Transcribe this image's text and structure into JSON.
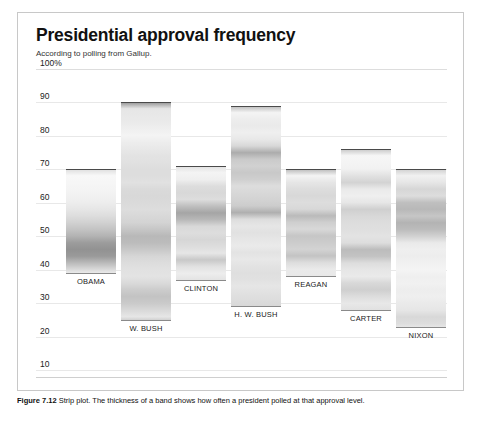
{
  "figure": {
    "title": "Presidential approval frequency",
    "subtitle": "According to polling from Gallup.",
    "caption_label": "Figure 7.12",
    "caption_text": "Strip plot. The thickness of a band shows how often a president polled at that approval level."
  },
  "chart_data": {
    "type": "strip",
    "title": "Presidential approval frequency",
    "subtitle": "According to polling from Gallup.",
    "xlabel": "",
    "ylabel": "",
    "ylim": [
      5,
      103
    ],
    "grid": true,
    "legend": "none",
    "y_ticks": [
      "100%",
      "90",
      "80",
      "70",
      "60",
      "50",
      "40",
      "30",
      "20",
      "10"
    ],
    "y_tick_values": [
      100,
      90,
      80,
      70,
      60,
      50,
      40,
      30,
      20,
      10
    ],
    "categories": [
      "OBAMA",
      "W. BUSH",
      "CLINTON",
      "H. W. BUSH",
      "REAGAN",
      "CARTER",
      "NIXON"
    ],
    "series": [
      {
        "name": "OBAMA",
        "label": "OBAMA",
        "min": 39,
        "max": 70,
        "median": 47,
        "bands": [
          {
            "value": 70,
            "density": 0.3
          },
          {
            "value": 68,
            "density": 0.06
          },
          {
            "value": 66,
            "density": 0.08
          },
          {
            "value": 64,
            "density": 0.1
          },
          {
            "value": 62,
            "density": 0.12
          },
          {
            "value": 60,
            "density": 0.16
          },
          {
            "value": 58,
            "density": 0.22
          },
          {
            "value": 56,
            "density": 0.3
          },
          {
            "value": 54,
            "density": 0.4
          },
          {
            "value": 52,
            "density": 0.52
          },
          {
            "value": 50,
            "density": 0.66
          },
          {
            "value": 48,
            "density": 0.86
          },
          {
            "value": 46,
            "density": 0.95
          },
          {
            "value": 44,
            "density": 0.88
          },
          {
            "value": 42,
            "density": 0.6
          },
          {
            "value": 40,
            "density": 0.32
          },
          {
            "value": 39,
            "density": 0.18
          }
        ]
      },
      {
        "name": "W. BUSH",
        "label": "W. BUSH",
        "min": 25,
        "max": 90,
        "median": 49,
        "bands": [
          {
            "value": 90,
            "density": 0.95
          },
          {
            "value": 88,
            "density": 0.22
          },
          {
            "value": 86,
            "density": 0.2
          },
          {
            "value": 84,
            "density": 0.18
          },
          {
            "value": 82,
            "density": 0.14
          },
          {
            "value": 80,
            "density": 0.1
          },
          {
            "value": 78,
            "density": 0.16
          },
          {
            "value": 76,
            "density": 0.2
          },
          {
            "value": 74,
            "density": 0.24
          },
          {
            "value": 72,
            "density": 0.26
          },
          {
            "value": 70,
            "density": 0.3
          },
          {
            "value": 68,
            "density": 0.3
          },
          {
            "value": 66,
            "density": 0.26
          },
          {
            "value": 64,
            "density": 0.32
          },
          {
            "value": 62,
            "density": 0.34
          },
          {
            "value": 60,
            "density": 0.32
          },
          {
            "value": 58,
            "density": 0.3
          },
          {
            "value": 56,
            "density": 0.34
          },
          {
            "value": 54,
            "density": 0.38
          },
          {
            "value": 52,
            "density": 0.5
          },
          {
            "value": 50,
            "density": 0.62
          },
          {
            "value": 48,
            "density": 0.58
          },
          {
            "value": 46,
            "density": 0.48
          },
          {
            "value": 44,
            "density": 0.36
          },
          {
            "value": 42,
            "density": 0.3
          },
          {
            "value": 40,
            "density": 0.26
          },
          {
            "value": 38,
            "density": 0.24
          },
          {
            "value": 36,
            "density": 0.32
          },
          {
            "value": 34,
            "density": 0.44
          },
          {
            "value": 32,
            "density": 0.52
          },
          {
            "value": 30,
            "density": 0.46
          },
          {
            "value": 28,
            "density": 0.34
          },
          {
            "value": 26,
            "density": 0.22
          },
          {
            "value": 25,
            "density": 0.4
          }
        ]
      },
      {
        "name": "CLINTON",
        "label": "CLINTON",
        "min": 37,
        "max": 71,
        "median": 57,
        "bands": [
          {
            "value": 71,
            "density": 0.26
          },
          {
            "value": 69,
            "density": 0.1
          },
          {
            "value": 67,
            "density": 0.14
          },
          {
            "value": 65,
            "density": 0.3
          },
          {
            "value": 63,
            "density": 0.34
          },
          {
            "value": 61,
            "density": 0.3
          },
          {
            "value": 59,
            "density": 0.56
          },
          {
            "value": 57,
            "density": 0.78
          },
          {
            "value": 55,
            "density": 0.62
          },
          {
            "value": 53,
            "density": 0.34
          },
          {
            "value": 51,
            "density": 0.3
          },
          {
            "value": 49,
            "density": 0.36
          },
          {
            "value": 47,
            "density": 0.3
          },
          {
            "value": 45,
            "density": 0.22
          },
          {
            "value": 43,
            "density": 0.48
          },
          {
            "value": 41,
            "density": 0.26
          },
          {
            "value": 39,
            "density": 0.16
          },
          {
            "value": 37,
            "density": 0.24
          }
        ]
      },
      {
        "name": "H. W. BUSH",
        "label": "H. W. BUSH",
        "min": 29,
        "max": 89,
        "median": 61,
        "bands": [
          {
            "value": 89,
            "density": 0.6
          },
          {
            "value": 87,
            "density": 0.1
          },
          {
            "value": 85,
            "density": 0.16
          },
          {
            "value": 83,
            "density": 0.18
          },
          {
            "value": 81,
            "density": 0.14
          },
          {
            "value": 79,
            "density": 0.2
          },
          {
            "value": 77,
            "density": 0.34
          },
          {
            "value": 75,
            "density": 0.72
          },
          {
            "value": 73,
            "density": 0.46
          },
          {
            "value": 71,
            "density": 0.4
          },
          {
            "value": 69,
            "density": 0.48
          },
          {
            "value": 67,
            "density": 0.42
          },
          {
            "value": 65,
            "density": 0.3
          },
          {
            "value": 63,
            "density": 0.34
          },
          {
            "value": 61,
            "density": 0.38
          },
          {
            "value": 59,
            "density": 0.44
          },
          {
            "value": 57,
            "density": 0.7
          },
          {
            "value": 55,
            "density": 0.3
          },
          {
            "value": 53,
            "density": 0.22
          },
          {
            "value": 51,
            "density": 0.26
          },
          {
            "value": 49,
            "density": 0.22
          },
          {
            "value": 47,
            "density": 0.18
          },
          {
            "value": 45,
            "density": 0.24
          },
          {
            "value": 43,
            "density": 0.2
          },
          {
            "value": 41,
            "density": 0.24
          },
          {
            "value": 39,
            "density": 0.28
          },
          {
            "value": 37,
            "density": 0.26
          },
          {
            "value": 35,
            "density": 0.22
          },
          {
            "value": 33,
            "density": 0.26
          },
          {
            "value": 31,
            "density": 0.3
          },
          {
            "value": 29,
            "density": 0.34
          }
        ]
      },
      {
        "name": "REAGAN",
        "label": "REAGAN",
        "min": 38,
        "max": 70,
        "median": 53,
        "bands": [
          {
            "value": 70,
            "density": 0.62
          },
          {
            "value": 68,
            "density": 0.1
          },
          {
            "value": 66,
            "density": 0.22
          },
          {
            "value": 64,
            "density": 0.3
          },
          {
            "value": 62,
            "density": 0.34
          },
          {
            "value": 60,
            "density": 0.3
          },
          {
            "value": 58,
            "density": 0.34
          },
          {
            "value": 56,
            "density": 0.6
          },
          {
            "value": 54,
            "density": 0.42
          },
          {
            "value": 52,
            "density": 0.34
          },
          {
            "value": 50,
            "density": 0.5
          },
          {
            "value": 48,
            "density": 0.44
          },
          {
            "value": 46,
            "density": 0.38
          },
          {
            "value": 44,
            "density": 0.52
          },
          {
            "value": 42,
            "density": 0.3
          },
          {
            "value": 40,
            "density": 0.18
          },
          {
            "value": 38,
            "density": 0.2
          }
        ]
      },
      {
        "name": "CARTER",
        "label": "CARTER",
        "min": 28,
        "max": 76,
        "median": 46,
        "bands": [
          {
            "value": 76,
            "density": 0.5
          },
          {
            "value": 74,
            "density": 0.08
          },
          {
            "value": 72,
            "density": 0.1
          },
          {
            "value": 70,
            "density": 0.12
          },
          {
            "value": 68,
            "density": 0.26
          },
          {
            "value": 66,
            "density": 0.38
          },
          {
            "value": 64,
            "density": 0.18
          },
          {
            "value": 62,
            "density": 0.14
          },
          {
            "value": 60,
            "density": 0.22
          },
          {
            "value": 58,
            "density": 0.42
          },
          {
            "value": 56,
            "density": 0.34
          },
          {
            "value": 54,
            "density": 0.3
          },
          {
            "value": 52,
            "density": 0.28
          },
          {
            "value": 50,
            "density": 0.24
          },
          {
            "value": 48,
            "density": 0.3
          },
          {
            "value": 46,
            "density": 0.58
          },
          {
            "value": 44,
            "density": 0.52
          },
          {
            "value": 42,
            "density": 0.3
          },
          {
            "value": 40,
            "density": 0.22
          },
          {
            "value": 38,
            "density": 0.18
          },
          {
            "value": 36,
            "density": 0.34
          },
          {
            "value": 34,
            "density": 0.42
          },
          {
            "value": 32,
            "density": 0.3
          },
          {
            "value": 30,
            "density": 0.2
          },
          {
            "value": 28,
            "density": 0.26
          }
        ]
      },
      {
        "name": "NIXON",
        "label": "NIXON",
        "min": 23,
        "max": 70,
        "median": 55,
        "bands": [
          {
            "value": 70,
            "density": 0.42
          },
          {
            "value": 68,
            "density": 0.12
          },
          {
            "value": 66,
            "density": 0.22
          },
          {
            "value": 64,
            "density": 0.36
          },
          {
            "value": 62,
            "density": 0.3
          },
          {
            "value": 60,
            "density": 0.56
          },
          {
            "value": 58,
            "density": 0.62
          },
          {
            "value": 56,
            "density": 0.5
          },
          {
            "value": 54,
            "density": 0.66
          },
          {
            "value": 52,
            "density": 0.58
          },
          {
            "value": 50,
            "density": 0.4
          },
          {
            "value": 48,
            "density": 0.18
          },
          {
            "value": 46,
            "density": 0.14
          },
          {
            "value": 44,
            "density": 0.16
          },
          {
            "value": 42,
            "density": 0.12
          },
          {
            "value": 40,
            "density": 0.1
          },
          {
            "value": 38,
            "density": 0.14
          },
          {
            "value": 36,
            "density": 0.12
          },
          {
            "value": 34,
            "density": 0.16
          },
          {
            "value": 32,
            "density": 0.14
          },
          {
            "value": 30,
            "density": 0.18
          },
          {
            "value": 28,
            "density": 0.22
          },
          {
            "value": 26,
            "density": 0.34
          },
          {
            "value": 24,
            "density": 0.3
          },
          {
            "value": 23,
            "density": 0.22
          }
        ]
      }
    ]
  }
}
